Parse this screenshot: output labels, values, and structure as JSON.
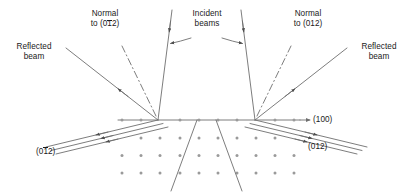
{
  "figure": {
    "type": "diagram",
    "colors": {
      "line": "#6e6e6e",
      "lattice_dot": "#9a9a9a",
      "text": "#1a1a1a",
      "background": "#ffffff"
    }
  },
  "labels": {
    "normal_left": {
      "line1": "Normal",
      "line2_prefix": "to (0",
      "line2_bar": "1",
      "line2_suffix": "2)"
    },
    "normal_right": {
      "line1": "Normal",
      "line2": "to (012)"
    },
    "incident": {
      "line1": "Incident",
      "line2": "beams"
    },
    "reflected_left": {
      "line1": "Reflected",
      "line2": "beam"
    },
    "reflected_right": {
      "line1": "Reflected",
      "line2": "beam"
    },
    "plane_100": "(100)",
    "plane_012_right": "(012)",
    "plane_012bar_left": {
      "prefix": "(0",
      "bar": "1",
      "suffix": "2)"
    }
  },
  "geometry": {
    "surface_line": {
      "x1": 118,
      "y1": 120,
      "x2": 300,
      "y2": 120
    },
    "vertex_left": {
      "x": 158,
      "y": 120
    },
    "vertex_right": {
      "x": 255,
      "y": 120
    },
    "surface_dots_y": 120,
    "lattice": {
      "rows": 3,
      "cols": 11,
      "x_start": 122,
      "y_start": 138,
      "dx": 19.2,
      "dy": 17.5,
      "radius": 1.5
    },
    "incident_beam_left": {
      "x1": 172,
      "y1": 10,
      "x2": 158,
      "y2": 120
    },
    "incident_beam_right": {
      "x1": 241,
      "y1": 10,
      "x2": 255,
      "y2": 120
    },
    "reflected_beam_left": {
      "x1": 158,
      "y1": 120,
      "x2": 66,
      "y2": 48
    },
    "reflected_beam_right": {
      "x1": 255,
      "y1": 120,
      "x2": 347,
      "y2": 48
    },
    "normal_dashdot_left": {
      "x1": 158,
      "y1": 120,
      "x2": 122,
      "y2": 46
    },
    "normal_dashdot_right": {
      "x1": 255,
      "y1": 120,
      "x2": 291,
      "y2": 46
    },
    "diffracted_left_count": 3,
    "diffracted_right_count": 3,
    "transmitted_left": {
      "x1": 196,
      "y1": 120,
      "x2": 172,
      "y2": 190
    },
    "transmitted_right": {
      "x1": 216,
      "y1": 120,
      "x2": 240,
      "y2": 190
    }
  }
}
